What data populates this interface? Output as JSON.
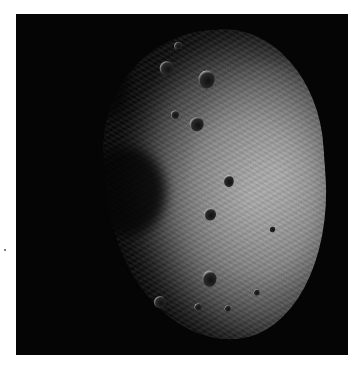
{
  "image": {
    "subject": "asteroid",
    "background_color": "#050505",
    "border_color": "#ffffff",
    "surface_tone": "#8a8a8a",
    "lit_side": "right"
  }
}
